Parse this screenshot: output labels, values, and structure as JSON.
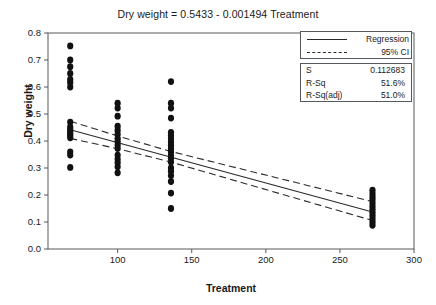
{
  "chart_data": {
    "type": "scatter",
    "title": "Dry weight =  0.5433 - 0.001494 Treatment",
    "xlabel": "Treatment",
    "ylabel": "Dry weight",
    "xlim": [
      53,
      300
    ],
    "ylim": [
      0.0,
      0.8
    ],
    "xticks": [
      100,
      150,
      200,
      250,
      300
    ],
    "yticks": [
      "0.0",
      "0.1",
      "0.2",
      "0.3",
      "0.4",
      "0.5",
      "0.6",
      "0.7",
      "0.8"
    ],
    "grid": false,
    "legend_position": "top-right",
    "regression": {
      "intercept": 0.5433,
      "slope": -0.001494,
      "x_start": 68,
      "x_end": 272
    },
    "confidence_interval": {
      "level": "95%",
      "upper": [
        [
          68,
          0.4735
        ],
        [
          100,
          0.4185
        ],
        [
          136,
          0.361
        ],
        [
          272,
          0.1755
        ]
      ],
      "lower": [
        [
          68,
          0.4095
        ],
        [
          100,
          0.3715
        ],
        [
          136,
          0.322
        ],
        [
          272,
          0.1055
        ]
      ]
    },
    "series": [
      {
        "name": "Observations",
        "points": [
          [
            68,
            0.752
          ],
          [
            68,
            0.7
          ],
          [
            68,
            0.675
          ],
          [
            68,
            0.65
          ],
          [
            68,
            0.628
          ],
          [
            68,
            0.617
          ],
          [
            68,
            0.6
          ],
          [
            68,
            0.47
          ],
          [
            68,
            0.452
          ],
          [
            68,
            0.443
          ],
          [
            68,
            0.435
          ],
          [
            68,
            0.427
          ],
          [
            68,
            0.42
          ],
          [
            68,
            0.412
          ],
          [
            68,
            0.36
          ],
          [
            68,
            0.348
          ],
          [
            68,
            0.302
          ],
          [
            100,
            0.54
          ],
          [
            100,
            0.522
          ],
          [
            100,
            0.492
          ],
          [
            100,
            0.455
          ],
          [
            100,
            0.44
          ],
          [
            100,
            0.425
          ],
          [
            100,
            0.41
          ],
          [
            100,
            0.398
          ],
          [
            100,
            0.385
          ],
          [
            100,
            0.372
          ],
          [
            100,
            0.348
          ],
          [
            100,
            0.333
          ],
          [
            100,
            0.32
          ],
          [
            100,
            0.305
          ],
          [
            100,
            0.282
          ],
          [
            136,
            0.62
          ],
          [
            136,
            0.54
          ],
          [
            136,
            0.522
          ],
          [
            136,
            0.485
          ],
          [
            136,
            0.432
          ],
          [
            136,
            0.42
          ],
          [
            136,
            0.408
          ],
          [
            136,
            0.396
          ],
          [
            136,
            0.384
          ],
          [
            136,
            0.372
          ],
          [
            136,
            0.36
          ],
          [
            136,
            0.348
          ],
          [
            136,
            0.336
          ],
          [
            136,
            0.322
          ],
          [
            136,
            0.3
          ],
          [
            136,
            0.288
          ],
          [
            136,
            0.272
          ],
          [
            136,
            0.25
          ],
          [
            136,
            0.207
          ],
          [
            136,
            0.15
          ],
          [
            272,
            0.218
          ],
          [
            272,
            0.205
          ],
          [
            272,
            0.193
          ],
          [
            272,
            0.182
          ],
          [
            272,
            0.17
          ],
          [
            272,
            0.158
          ],
          [
            272,
            0.147
          ],
          [
            272,
            0.136
          ],
          [
            272,
            0.124
          ],
          [
            272,
            0.112
          ],
          [
            272,
            0.1
          ],
          [
            272,
            0.088
          ]
        ]
      }
    ]
  },
  "legend": {
    "entries": [
      {
        "label": "Regression",
        "style": "solid"
      },
      {
        "label": "95% CI",
        "style": "dashed"
      }
    ]
  },
  "stats": {
    "rows": [
      {
        "key": "S",
        "value": "0.112683"
      },
      {
        "key": "R-Sq",
        "value": "51.6%"
      },
      {
        "key": "R-Sq(adj)",
        "value": "51.0%"
      }
    ]
  },
  "colors": {
    "marker": "#111111",
    "line": "#2b2b2b",
    "frame": "#55595c"
  }
}
